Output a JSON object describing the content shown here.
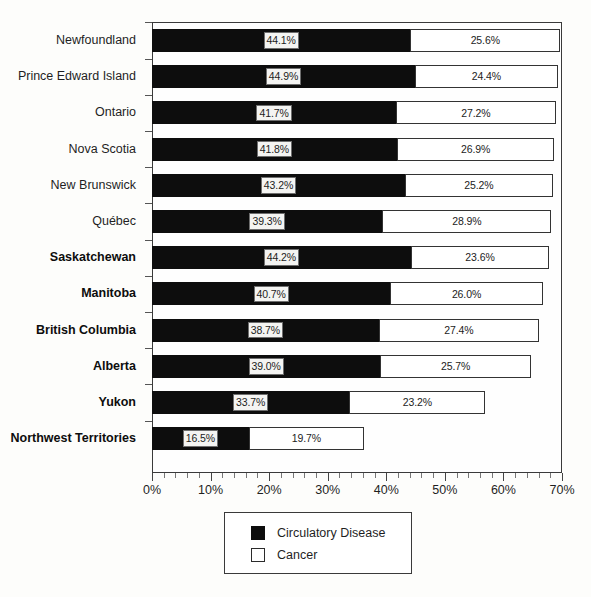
{
  "chart_data": {
    "type": "bar",
    "orientation": "horizontal",
    "stacked": true,
    "title": "",
    "xlabel": "",
    "ylabel": "",
    "xlim": [
      0,
      70
    ],
    "xtick_labels": [
      "0%",
      "10%",
      "20%",
      "30%",
      "40%",
      "50%",
      "60%",
      "70%"
    ],
    "xtick_values": [
      0,
      10,
      20,
      30,
      40,
      50,
      60,
      70
    ],
    "minor_tick_step": 2,
    "grid": false,
    "legend_position": "bottom-center",
    "categories": [
      "Newfoundland",
      "Prince Edward Island",
      "Ontario",
      "Nova Scotia",
      "New Brunswick",
      "Québec",
      "Saskatchewan",
      "Manitoba",
      "British Columbia",
      "Alberta",
      "Yukon",
      "Northwest Territories"
    ],
    "categories_bold": [
      false,
      false,
      false,
      false,
      false,
      false,
      true,
      true,
      true,
      true,
      true,
      true
    ],
    "series": [
      {
        "name": "Circulatory Disease",
        "color": "#0d0d0d",
        "values": [
          44.1,
          44.9,
          41.7,
          41.8,
          43.2,
          39.3,
          44.2,
          40.7,
          38.7,
          39.0,
          33.7,
          16.5
        ],
        "labels": [
          "44.1%",
          "44.9%",
          "41.7%",
          "41.8%",
          "43.2%",
          "39.3%",
          "44.2%",
          "40.7%",
          "38.7%",
          "39.0%",
          "33.7%",
          "16.5%"
        ]
      },
      {
        "name": "Cancer",
        "color": "#ffffff",
        "values": [
          25.6,
          24.4,
          27.2,
          26.9,
          25.2,
          28.9,
          23.6,
          26.0,
          27.4,
          25.7,
          23.2,
          19.7
        ],
        "labels": [
          "25.6%",
          "24.4%",
          "27.2%",
          "26.9%",
          "25.2%",
          "28.9%",
          "23.6%",
          "26.0%",
          "27.4%",
          "25.7%",
          "23.2%",
          "19.7%"
        ]
      }
    ]
  },
  "legend": {
    "items": [
      {
        "label": "Circulatory Disease",
        "swatch": "black"
      },
      {
        "label": "Cancer",
        "swatch": "white"
      }
    ]
  }
}
